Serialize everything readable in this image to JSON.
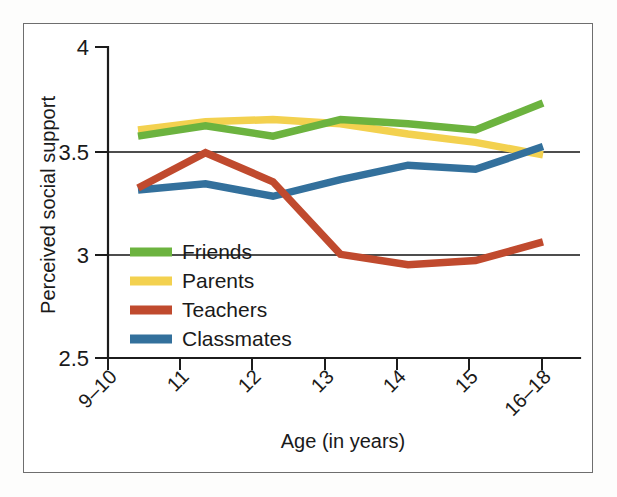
{
  "chart_data": {
    "type": "line",
    "title": "",
    "xlabel": "Age (in years)",
    "ylabel": "Perceived social support",
    "categories": [
      "9–10",
      "11",
      "12",
      "13",
      "14",
      "15",
      "16–18"
    ],
    "ylim": [
      2.5,
      4
    ],
    "yticks": [
      "2.5",
      "3",
      "3.5",
      "4"
    ],
    "ytick_values": [
      2.5,
      3,
      3.5,
      4
    ],
    "grid": "horizontal gridlines at 3 and 3.5",
    "legend_position": "inside lower-left of plot area",
    "series": [
      {
        "name": "Friends",
        "color": "#6cb33f",
        "values": [
          3.57,
          3.62,
          3.57,
          3.65,
          3.63,
          3.6,
          3.73
        ]
      },
      {
        "name": "Parents",
        "color": "#f3d14f",
        "values": [
          3.6,
          3.64,
          3.65,
          3.63,
          3.58,
          3.54,
          3.48
        ]
      },
      {
        "name": "Teachers",
        "color": "#c04a2e",
        "values": [
          3.32,
          3.49,
          3.35,
          3.0,
          2.95,
          2.97,
          3.06
        ]
      },
      {
        "name": "Classmates",
        "color": "#33709c",
        "values": [
          3.31,
          3.34,
          3.28,
          3.36,
          3.43,
          3.41,
          3.52
        ]
      }
    ]
  },
  "legend": {
    "items": [
      {
        "label": "Friends",
        "color": "#6cb33f"
      },
      {
        "label": "Parents",
        "color": "#f3d14f"
      },
      {
        "label": "Teachers",
        "color": "#c04a2e"
      },
      {
        "label": "Classmates",
        "color": "#33709c"
      }
    ]
  },
  "axes": {
    "x_title": "Age (in years)",
    "y_title": "Perceived social support",
    "y_tick_labels": [
      "4",
      "3.5",
      "3",
      "2.5"
    ],
    "x_tick_labels": [
      "9–10",
      "11",
      "12",
      "13",
      "14",
      "15",
      "16–18"
    ]
  }
}
